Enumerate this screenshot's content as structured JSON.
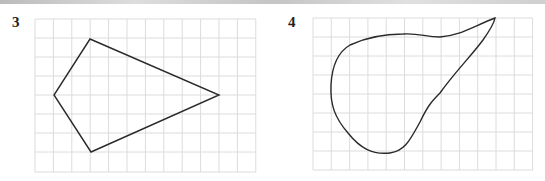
{
  "figures": [
    {
      "label": "3",
      "shape": "quadrilateral (kite)",
      "grid": {
        "cols": 12,
        "rows": 8
      }
    },
    {
      "label": "4",
      "shape": "irregular closed curve (pear-shaped)",
      "grid": {
        "cols": 12,
        "rows": 8
      }
    }
  ],
  "colors": {
    "grid": "#dcdcdc",
    "outline": "#2a2a2a"
  }
}
